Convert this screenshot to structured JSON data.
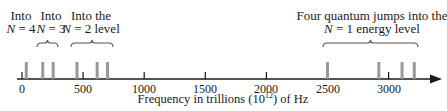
{
  "diagram": {
    "axis": {
      "title_prefix": "Frequency in trillions (10",
      "title_exp": "12",
      "title_suffix": ") of Hz",
      "ticks": [
        {
          "label": "0",
          "value": 0
        },
        {
          "label": "500",
          "value": 500
        },
        {
          "label": "1000",
          "value": 1000
        },
        {
          "label": "1500",
          "value": 1500
        },
        {
          "label": "2000",
          "value": 2000
        },
        {
          "label": "2500",
          "value": 2500
        },
        {
          "label": "3000",
          "value": 3000
        }
      ],
      "x_px_per_unit": 0.1222,
      "x_origin_px": 22,
      "line_y": 79,
      "line_x_start": 17,
      "arrow_tip_x": 442,
      "color": "#1a1a1a"
    },
    "groups": [
      {
        "id": "n4",
        "line1": "Into",
        "n_var": "N",
        "line2_rest": " = 4",
        "label_x": 21,
        "lines": [
          35
        ]
      },
      {
        "id": "n3",
        "line1": "Into",
        "n_var": "N",
        "line2_rest": " = 3",
        "label_x": 51,
        "lines": [
          170,
          255
        ],
        "brace": [
          37,
          58
        ]
      },
      {
        "id": "n2",
        "line1": "Into the",
        "n_var": "N",
        "line2_rest": " = 2 level",
        "label_x": 91,
        "lines": [
          450,
          615,
          700
        ],
        "brace": [
          71,
          113
        ]
      },
      {
        "id": "n1",
        "line1": "Four quantum jumps into the",
        "n_var": "N",
        "line2_rest": " = 1 energy level",
        "label_x": 372,
        "lines": [
          2500,
          2920,
          3110,
          3210
        ],
        "brace": [
          323,
          418
        ]
      }
    ],
    "spectral_line_color": "#999999",
    "brace_color": "#555555"
  }
}
